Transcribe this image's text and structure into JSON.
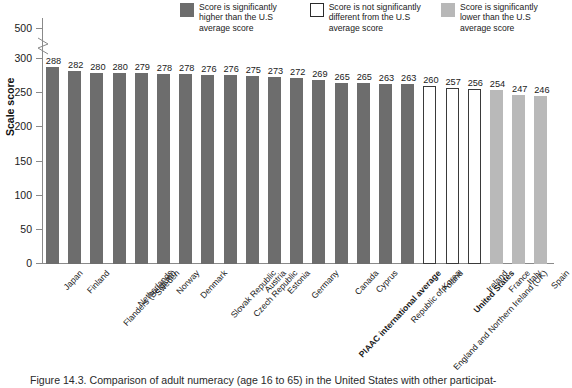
{
  "legend": {
    "items": [
      {
        "swatch": "dark-gray-swatch-icon",
        "label": "Score is significantly higher than the U.S average score"
      },
      {
        "swatch": "open-white-swatch-icon",
        "label": "Score is not significantly different from the U.S average score"
      },
      {
        "swatch": "light-gray-swatch-icon",
        "label": "Score is significantly lower than the U.S average score"
      }
    ]
  },
  "axis": {
    "y_title": "Scale score",
    "ticks": [
      "500",
      "300",
      "250",
      "200",
      "150",
      "100",
      "50",
      "0"
    ],
    "break_between": [
      "300",
      "500"
    ]
  },
  "caption": {
    "text": "Figure 14.3. Comparison of adult numeracy (age 16 to 65) in the United States with other participat-"
  },
  "colors": {
    "higher": "#6d6d6d",
    "not_different": "#ffffff",
    "lower": "#b9b9b9",
    "axis": "#8a8a8a"
  },
  "chart_data": {
    "type": "bar",
    "title": "",
    "xlabel": "",
    "ylabel": "Scale score",
    "ylim": [
      0,
      300
    ],
    "grid": false,
    "legend_position": "top-right",
    "categories": [
      "Japan",
      "Finland",
      "Flanders (Belgium)",
      "Netherlands",
      "Sweden",
      "Norway",
      "Denmark",
      "Slovak Republic",
      "Czech Republic",
      "Austria",
      "Estonia",
      "Germany",
      "PIAAC international average",
      "Canada",
      "Cyprus",
      "Republic of Korea",
      "England and Northern Ireland (UK)",
      "Poland",
      "United States",
      "Ireland",
      "France",
      "Italy",
      "Spain"
    ],
    "values": [
      288,
      282,
      280,
      280,
      279,
      278,
      278,
      276,
      276,
      275,
      273,
      272,
      269,
      265,
      265,
      263,
      263,
      260,
      257,
      256,
      254,
      247,
      246
    ],
    "groups": [
      "higher",
      "higher",
      "higher",
      "higher",
      "higher",
      "higher",
      "higher",
      "higher",
      "higher",
      "higher",
      "higher",
      "higher",
      "higher",
      "higher",
      "higher",
      "higher",
      "higher",
      "not_different",
      "not_different",
      "not_different",
      "lower",
      "lower",
      "lower"
    ],
    "bold_categories": [
      "PIAAC international average",
      "United States"
    ],
    "series": [
      {
        "name": "Adult numeracy scale score",
        "values": [
          288,
          282,
          280,
          280,
          279,
          278,
          278,
          276,
          276,
          275,
          273,
          272,
          269,
          265,
          265,
          263,
          263,
          260,
          257,
          256,
          254,
          247,
          246
        ]
      }
    ]
  }
}
